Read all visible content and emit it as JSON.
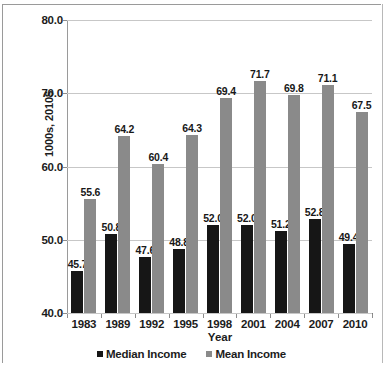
{
  "chart_data": {
    "type": "bar",
    "title": "",
    "subtitle": "",
    "xlabel": "Year",
    "ylabel": "1000s, 2010$",
    "ylim": [
      40.0,
      80.0
    ],
    "yticks": [
      "40.0",
      "50.0",
      "60.0",
      "70.0",
      "80.0"
    ],
    "grid": true,
    "legend_position": "bottom",
    "categories": [
      "1983",
      "1989",
      "1992",
      "1995",
      "1998",
      "2001",
      "2004",
      "2007",
      "2010"
    ],
    "series": [
      {
        "name": "Median Income",
        "color": "#161616",
        "values": [
          45.7,
          50.8,
          47.6,
          48.8,
          52.0,
          52.0,
          51.2,
          52.8,
          49.4
        ],
        "labels": [
          "45.7",
          "50.8",
          "47.6",
          "48.8",
          "52.0",
          "52.0",
          "51.2",
          "52.8",
          "49.4"
        ]
      },
      {
        "name": "Mean Income",
        "color": "#8a8a8a",
        "values": [
          55.6,
          64.2,
          60.4,
          64.3,
          69.4,
          71.7,
          69.8,
          71.1,
          67.5
        ],
        "labels": [
          "55.6",
          "64.2",
          "60.4",
          "64.3",
          "69.4",
          "71.7",
          "69.8",
          "71.1",
          "67.5"
        ]
      }
    ]
  },
  "legend": {
    "items": [
      {
        "label": "Median Income",
        "swatch": "median-swatch"
      },
      {
        "label": "Mean Income",
        "swatch": "mean-swatch"
      }
    ]
  }
}
